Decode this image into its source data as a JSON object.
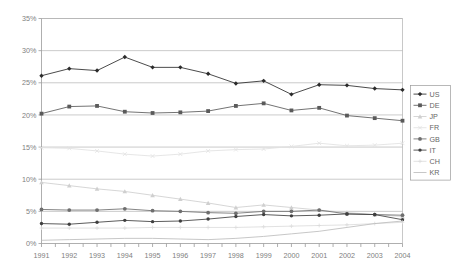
{
  "chart_data": {
    "type": "line",
    "title": "",
    "subtitle": "",
    "xlabel": "",
    "ylabel": "",
    "x": [
      1991,
      1992,
      1993,
      1994,
      1995,
      1996,
      1997,
      1998,
      1999,
      2000,
      2001,
      2002,
      2003,
      2004
    ],
    "xtick_labels": [
      "1991",
      "1992",
      "1993",
      "1994",
      "1995",
      "1996",
      "1997",
      "1998",
      "1999",
      "2000",
      "2001",
      "2002",
      "2003",
      "2004"
    ],
    "ytick_labels": [
      "0%",
      "5%",
      "10%",
      "15%",
      "20%",
      "25%",
      "30%",
      "35%"
    ],
    "ytick_values": [
      0,
      5,
      10,
      15,
      20,
      25,
      30,
      35
    ],
    "ylim": [
      0,
      35
    ],
    "xlim": [
      1991,
      2004
    ],
    "grid": "horizontal",
    "legend_position": "right",
    "series": [
      {
        "name": "US",
        "color": "#2b2b2b",
        "marker": "diamond",
        "values": [
          26.1,
          27.2,
          26.9,
          29.0,
          27.4,
          27.4,
          26.4,
          24.9,
          25.3,
          23.2,
          24.7,
          24.6,
          24.1,
          23.9
        ]
      },
      {
        "name": "DE",
        "color": "#5a5a5a",
        "marker": "square",
        "values": [
          20.2,
          21.3,
          21.4,
          20.5,
          20.3,
          20.4,
          20.6,
          21.4,
          21.8,
          20.7,
          21.1,
          19.9,
          19.5,
          19.1
        ]
      },
      {
        "name": "JP",
        "color": "#cfcfcf",
        "marker": "triangle",
        "values": [
          9.5,
          9.0,
          8.5,
          8.1,
          7.5,
          6.9,
          6.3,
          5.6,
          6.0,
          5.6,
          5.2,
          4.8,
          4.5,
          4.2
        ]
      },
      {
        "name": "FR",
        "color": "#e2e2e2",
        "marker": "cross",
        "values": [
          14.9,
          14.8,
          14.4,
          13.9,
          13.6,
          13.9,
          14.4,
          14.6,
          14.7,
          15.1,
          15.6,
          15.2,
          15.3,
          15.6
        ]
      },
      {
        "name": "GB",
        "color": "#6e6e6e",
        "marker": "circle",
        "values": [
          5.3,
          5.2,
          5.2,
          5.4,
          5.1,
          5.0,
          4.8,
          4.7,
          5.0,
          5.0,
          5.2,
          4.6,
          4.5,
          4.4
        ]
      },
      {
        "name": "IT",
        "color": "#3f3f3f",
        "marker": "dot",
        "values": [
          3.1,
          3.0,
          3.3,
          3.6,
          3.4,
          3.5,
          3.8,
          4.2,
          4.5,
          4.3,
          4.4,
          4.6,
          4.5,
          3.7
        ]
      },
      {
        "name": "CH",
        "color": "#dcdcdc",
        "marker": "plus",
        "values": [
          2.4,
          2.4,
          2.4,
          2.4,
          2.5,
          2.5,
          2.5,
          2.5,
          2.6,
          2.7,
          2.8,
          2.9,
          3.1,
          3.3
        ]
      },
      {
        "name": "KR",
        "color": "#bdbdbd",
        "marker": "line",
        "values": [
          0.5,
          0.6,
          0.7,
          0.8,
          0.8,
          0.7,
          0.6,
          0.8,
          1.1,
          1.5,
          1.9,
          2.5,
          3.1,
          3.5
        ]
      }
    ]
  }
}
